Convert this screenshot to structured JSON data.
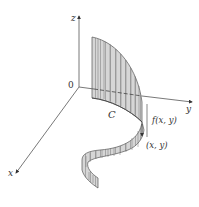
{
  "figure": {
    "axes": {
      "x_label": "x",
      "y_label": "y",
      "z_label": "z",
      "origin_label": "0"
    },
    "annotations": {
      "curve_label": "C",
      "height_label": "f(x, y)",
      "point_label": "(x, y)"
    },
    "colors": {
      "surface_fill": "#d4d4d4",
      "surface_front": "#c2c2c2",
      "stroke": "#555555",
      "axis": "#555555",
      "background": "#ffffff"
    }
  }
}
